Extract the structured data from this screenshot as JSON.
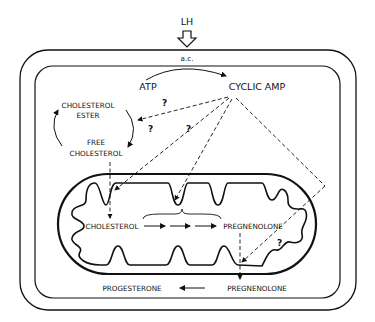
{
  "diagram": {
    "stimulus": "LH",
    "enzyme": "a.c.",
    "cytoplasm": {
      "atp": "ATP",
      "cyclic_amp": "CYCLIC AMP",
      "cholesterol_ester_line1": "CHOLESTEROL",
      "cholesterol_ester_line2": "ESTER",
      "free_cholesterol_line1": "FREE",
      "free_cholesterol_line2": "CHOLESTEROL",
      "progesterone": "PROGESTERONE",
      "pregnenolone": "PREGNENOLONE"
    },
    "mitochondrion": {
      "cholesterol": "CHOLESTEROL",
      "pregnenolone": "PREGNENOLONE"
    },
    "question_mark": "?",
    "colors": {
      "ink": "#111111",
      "background": "#ffffff"
    }
  }
}
